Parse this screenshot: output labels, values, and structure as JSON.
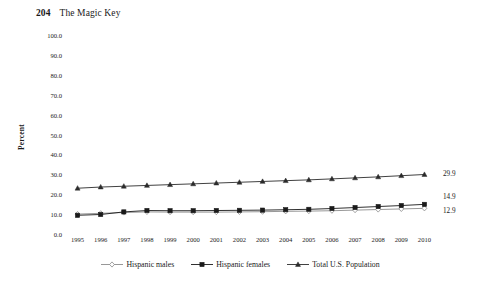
{
  "running_head": {
    "folio": "204",
    "book_title": "The Magic Key"
  },
  "chart_data": {
    "type": "line",
    "title": "",
    "subtitle": "",
    "xlabel": "",
    "ylabel": "Percent",
    "ylim": [
      0,
      100
    ],
    "y_ticks": [
      "0.0",
      "10.0",
      "20.0",
      "30.0",
      "40.0",
      "50.0",
      "60.0",
      "70.0",
      "80.0",
      "90.0",
      "100.0"
    ],
    "grid": false,
    "legend_position": "bottom",
    "x": [
      "1995",
      "1996",
      "1997",
      "1998",
      "1999",
      "2000",
      "2001",
      "2002",
      "2003",
      "2004",
      "2005",
      "2006",
      "2007",
      "2008",
      "2009",
      "2010"
    ],
    "categories": [
      "1995",
      "1996",
      "1997",
      "1998",
      "1999",
      "2000",
      "2001",
      "2002",
      "2003",
      "2004",
      "2005",
      "2006",
      "2007",
      "2008",
      "2009",
      "2010"
    ],
    "series": [
      {
        "name": "Hispanic males",
        "marker": "open-diamond",
        "color": "#8c8c8c",
        "end_label": "12.9",
        "values": [
          10.0,
          10.4,
          10.8,
          11.1,
          11.0,
          11.0,
          11.0,
          11.1,
          11.2,
          11.4,
          11.5,
          11.7,
          12.0,
          12.3,
          12.6,
          12.9
        ]
      },
      {
        "name": "Hispanic females",
        "marker": "filled-square",
        "color": "#1a1a1a",
        "end_label": "14.9",
        "values": [
          9.4,
          9.8,
          11.1,
          11.8,
          11.7,
          11.7,
          11.8,
          11.9,
          12.0,
          12.2,
          12.4,
          12.8,
          13.3,
          13.8,
          14.3,
          14.9
        ]
      },
      {
        "name": "Total U.S. Population",
        "marker": "filled-triangle",
        "color": "#2b2b2b",
        "end_label": "29.9",
        "values": [
          23.0,
          23.6,
          24.0,
          24.4,
          24.8,
          25.2,
          25.6,
          26.0,
          26.4,
          26.8,
          27.2,
          27.7,
          28.2,
          28.7,
          29.3,
          29.9
        ]
      }
    ]
  }
}
